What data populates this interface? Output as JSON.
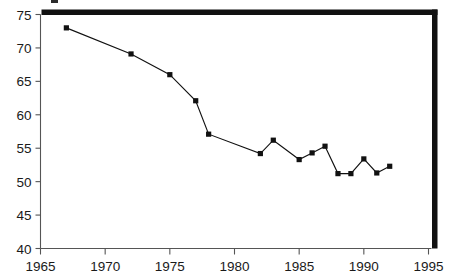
{
  "chart_data": {
    "type": "line",
    "title": "",
    "subtitle": "",
    "xlabel": "",
    "ylabel": "",
    "xlim": [
      1965,
      1995
    ],
    "ylim": [
      40,
      75
    ],
    "xticks": [
      1965,
      1970,
      1975,
      1980,
      1985,
      1990,
      1995
    ],
    "yticks": [
      40,
      45,
      50,
      55,
      60,
      65,
      70,
      75
    ],
    "xtick_labels": [
      "1965",
      "1970",
      "1975",
      "1980",
      "1985",
      "1990",
      "1995"
    ],
    "ytick_labels": [
      "40",
      "45",
      "50",
      "55",
      "60",
      "65",
      "70",
      "75"
    ],
    "grid": false,
    "legend": null,
    "legend_position": "none",
    "marker": "filled-square",
    "line_color": "#111111",
    "marker_color": "#111111",
    "axis_color": "#555555",
    "frame_color": "#111111",
    "background_color": "#ffffff",
    "series": [
      {
        "name": "series-1",
        "x": [
          1967,
          1972,
          1975,
          1977,
          1978,
          1982,
          1983,
          1985,
          1986,
          1987,
          1988,
          1989,
          1990,
          1991,
          1992
        ],
        "values": [
          73.0,
          69.1,
          66.0,
          62.1,
          57.1,
          54.2,
          56.2,
          53.3,
          54.3,
          55.3,
          51.2,
          51.2,
          53.4,
          51.3,
          52.3
        ]
      }
    ]
  },
  "axes": {
    "y_axis_name": "y-axis",
    "x_axis_name": "x-axis"
  }
}
